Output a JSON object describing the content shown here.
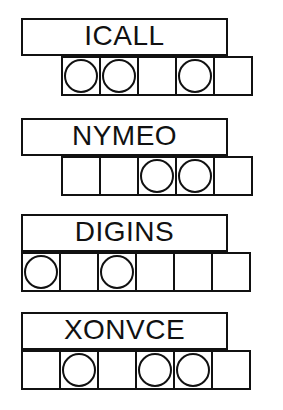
{
  "page": {
    "background_color": "#ffffff",
    "ink_color": "#111111",
    "width": 283,
    "height": 410
  },
  "groups": [
    {
      "id": "group-1",
      "word": "ICALL",
      "word_box_top": 18,
      "strip_top": 56,
      "strip_left": 61,
      "cell_count": 5,
      "circles": [
        true,
        true,
        false,
        true,
        false
      ]
    },
    {
      "id": "group-2",
      "word": "NYMEO",
      "word_box_top": 118,
      "strip_top": 156,
      "strip_left": 61,
      "cell_count": 5,
      "circles": [
        false,
        false,
        true,
        true,
        false
      ]
    },
    {
      "id": "group-3",
      "word": "DIGINS",
      "word_box_top": 214,
      "strip_top": 252,
      "strip_left": 21,
      "cell_count": 6,
      "circles": [
        true,
        false,
        true,
        false,
        false,
        false
      ]
    },
    {
      "id": "group-4",
      "word": "XONVCE",
      "word_box_top": 312,
      "strip_top": 350,
      "strip_left": 21,
      "cell_count": 6,
      "circles": [
        false,
        true,
        false,
        true,
        true,
        false
      ]
    }
  ]
}
